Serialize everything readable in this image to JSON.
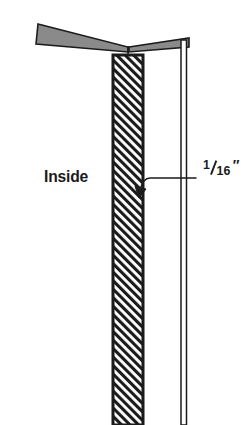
{
  "figure": {
    "type": "technical-cross-section-illustration",
    "background_color": "#ffffff",
    "line_color": "#1b1b1b",
    "wedge_fill_color": "#8a8a8a",
    "hatch_color": "#1b1b1b",
    "labels": {
      "inside": "Inside",
      "dimension_numerator": "1",
      "dimension_denominator": "16",
      "dimension_unit": "″"
    },
    "parts": {
      "left_wedge_name": "left-tapered-flange",
      "right_wedge_name": "right-tapered-flange",
      "hatched_member_name": "hatched-section-member",
      "vertical_bar_name": "right-vertical-jamb",
      "leader_name": "dimension-leader-line",
      "arrow_name": "leader-arrowhead"
    }
  }
}
